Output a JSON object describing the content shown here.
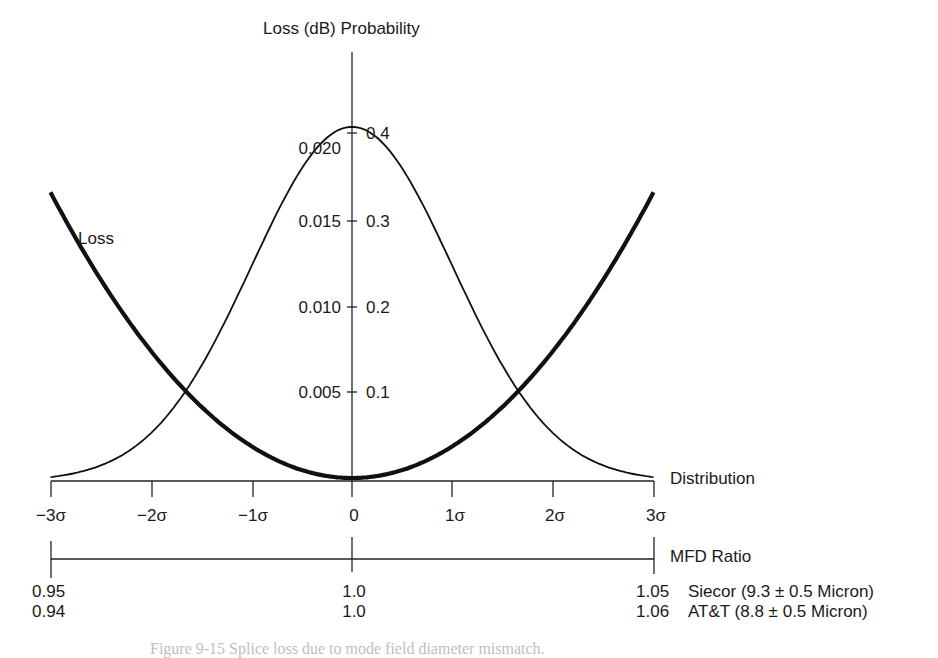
{
  "chart_data": {
    "type": "line",
    "title": "",
    "left_axis_label": "Loss (dB)",
    "right_axis_label": "Probability",
    "xlabel": "Distribution",
    "secondary_xlabel": "MFD Ratio",
    "x_ticks": [
      "−3σ",
      "−2σ",
      "−1σ",
      "0",
      "1σ",
      "2σ",
      "3σ"
    ],
    "x_values": [
      -3,
      -2,
      -1,
      0,
      1,
      2,
      3
    ],
    "loss_ticks": [
      "0.005",
      "0.010",
      "0.015",
      "0.020"
    ],
    "probability_ticks": [
      "0.1",
      "0.2",
      "0.3",
      "0.4"
    ],
    "ylim_loss": [
      0,
      0.0235
    ],
    "ylim_probability": [
      0,
      0.4
    ],
    "grid": false,
    "series": [
      {
        "name": "Distribution",
        "style": "thin",
        "x": [
          -3,
          -2.5,
          -2,
          -1.5,
          -1,
          -0.5,
          0,
          0.5,
          1,
          1.5,
          2,
          2.5,
          3
        ],
        "values": [
          0.004,
          0.018,
          0.054,
          0.13,
          0.242,
          0.352,
          0.399,
          0.352,
          0.242,
          0.13,
          0.054,
          0.018,
          0.004
        ]
      },
      {
        "name": "Loss",
        "style": "thick",
        "x": [
          -3,
          -2.5,
          -2,
          -1.5,
          -1,
          -0.5,
          0,
          0.5,
          1,
          1.5,
          2,
          2.5,
          3
        ],
        "values": [
          0.016,
          0.0111,
          0.0071,
          0.004,
          0.0018,
          0.0004,
          0.0,
          0.0004,
          0.0018,
          0.004,
          0.0071,
          0.0111,
          0.0161
        ]
      }
    ],
    "mfd_ratio_scale": [
      {
        "position": "−3σ",
        "siecor": "0.95",
        "att": "0.94"
      },
      {
        "position": "0",
        "siecor": "1.0",
        "att": "1.0"
      },
      {
        "position": "3σ",
        "siecor": "1.05",
        "att": "1.06"
      }
    ],
    "mfd_legend": [
      {
        "name": "Siecor",
        "text": "Siecor (9.3 ± 0.5 Micron)"
      },
      {
        "name": "AT&T",
        "text": "AT&T (8.8 ± 0.5 Micron)"
      }
    ],
    "annotations": [
      "Loss",
      "Distribution",
      "MFD Ratio"
    ]
  },
  "labels": {
    "top": "Loss (dB) Probability",
    "loss_curve": "Loss",
    "distribution": "Distribution",
    "mfd_ratio": "MFD Ratio",
    "loss_ticks": [
      "0.020",
      "0.015",
      "0.010",
      "0.005"
    ],
    "prob_ticks": [
      "0.4",
      "0.3",
      "0.2",
      "0.1"
    ],
    "x_ticks": [
      "−3σ",
      "−2σ",
      "−1σ",
      "0",
      "1σ",
      "2σ",
      "3σ"
    ],
    "mfd_left": [
      "0.95",
      "0.94"
    ],
    "mfd_center": [
      "1.0",
      "1.0"
    ],
    "mfd_right": [
      "1.05",
      "1.06"
    ],
    "mfd_right_names": [
      "Siecor (9.3 ± 0.5 Micron)",
      "AT&T (8.8 ± 0.5 Micron)"
    ]
  },
  "caption": "Figure 9-15   Splice loss due to mode field diameter mismatch."
}
